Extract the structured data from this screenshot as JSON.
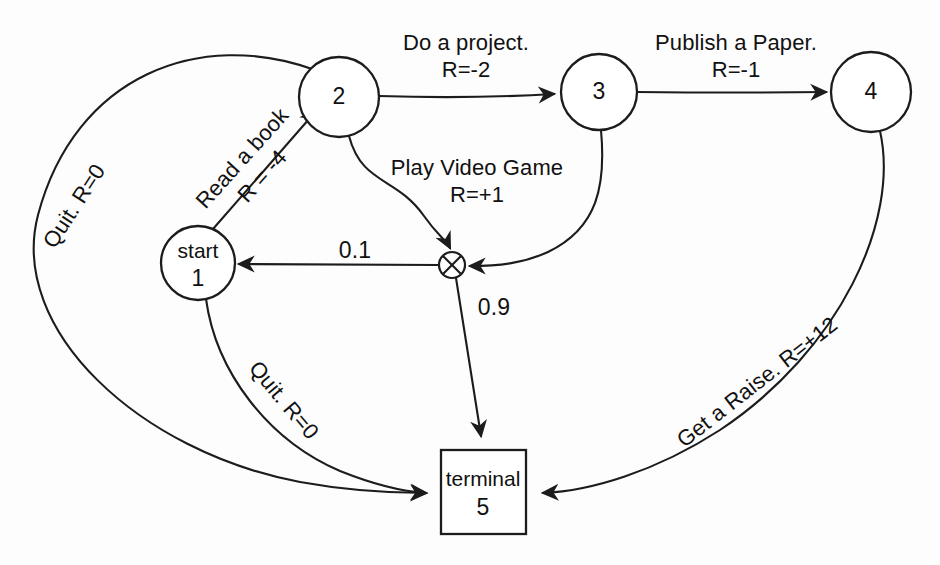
{
  "diagram": {
    "background_color": "#fdfdfd",
    "stroke_color": "#1c1c1c"
  },
  "nodes": [
    {
      "id": "start",
      "shape": "circle",
      "line1": "start",
      "line2": "1",
      "cx": 198,
      "cy": 263,
      "r": 37
    },
    {
      "id": "n2",
      "shape": "circle",
      "line1": "",
      "line2": "2",
      "cx": 339,
      "cy": 97,
      "r": 40
    },
    {
      "id": "n3",
      "shape": "circle",
      "line1": "",
      "line2": "3",
      "cx": 599,
      "cy": 92,
      "r": 38
    },
    {
      "id": "n4",
      "shape": "circle",
      "line1": "",
      "line2": "4",
      "cx": 871,
      "cy": 92,
      "r": 40
    },
    {
      "id": "terminal",
      "shape": "square",
      "line1": "terminal",
      "line2": "5",
      "cx": 483,
      "cy": 492,
      "w": 85,
      "h": 84
    },
    {
      "id": "junction",
      "shape": "crossed-circle",
      "line1": "",
      "line2": "",
      "cx": 452,
      "cy": 265,
      "r": 13
    }
  ],
  "edges": [
    {
      "id": "start-to-2",
      "from": "start",
      "to": "n2",
      "action": "Read a book",
      "reward": "R = -4",
      "label_line1": "Read a book",
      "label_line2": "R = -4",
      "label_x": 254,
      "label_y": 165,
      "rotation_deg": -48
    },
    {
      "id": "2-to-3",
      "from": "n2",
      "to": "n3",
      "action": "Do a project.",
      "reward": "R=-2",
      "label_line1": "Do a project.",
      "label_line2": "R=-2",
      "label_x": 466,
      "label_y": 56,
      "rotation_deg": 0
    },
    {
      "id": "3-to-4",
      "from": "n3",
      "to": "n4",
      "action": "Publish a Paper.",
      "reward": "R=-1",
      "label_line1": "Publish a Paper.",
      "label_line2": "R=-1",
      "label_x": 736,
      "label_y": 56,
      "rotation_deg": 0
    },
    {
      "id": "2-to-junction",
      "from": "n2",
      "to": "junction",
      "action": "Play Video Game",
      "reward": "R=+1",
      "label_line1": "Play Video Game",
      "label_line2": "R=+1",
      "label_x": 477,
      "label_y": 181,
      "rotation_deg": 0
    },
    {
      "id": "3-to-junction",
      "from": "n3",
      "to": "junction",
      "action": "",
      "reward": "",
      "label_line1": "",
      "label_line2": "",
      "label_x": 0,
      "label_y": 0,
      "rotation_deg": 0
    },
    {
      "id": "junction-to-start",
      "from": "junction",
      "to": "start",
      "action": "",
      "reward": "",
      "probability": "0.1",
      "label_x": 355,
      "label_y": 250,
      "rotation_deg": 0
    },
    {
      "id": "junction-to-terminal",
      "from": "junction",
      "to": "terminal",
      "action": "",
      "reward": "",
      "probability": "0.9",
      "label_x": 492,
      "label_y": 307,
      "rotation_deg": 0
    },
    {
      "id": "2-to-terminal",
      "from": "n2",
      "to": "terminal",
      "action": "Quit.",
      "reward": "R=0",
      "label_line1": "Quit. R=0",
      "label_line2": "",
      "label_x": 73,
      "label_y": 205,
      "rotation_deg": -57
    },
    {
      "id": "start-to-terminal",
      "from": "start",
      "to": "terminal",
      "action": "Quit.",
      "reward": "R=0",
      "label_line1": "Quit. R=0",
      "label_line2": "",
      "label_x": 283,
      "label_y": 400,
      "rotation_deg": 50
    },
    {
      "id": "4-to-terminal",
      "from": "n4",
      "to": "terminal",
      "action": "Get a Raise.",
      "reward": "R=+12",
      "label_line1": "Get a Raise. R=+12",
      "label_line2": "",
      "label_x": 755,
      "label_y": 385,
      "rotation_deg": -38
    }
  ],
  "labels": {
    "do_a_project": "Do a project.",
    "do_a_project_reward": "R=-2",
    "publish_a_paper": "Publish a Paper.",
    "publish_a_paper_reward": "R=-1",
    "read_a_book": "Read a book",
    "read_a_book_reward": "R = -4",
    "play_video_game": "Play Video Game",
    "play_video_game_reward": "R=+1",
    "quit_top": "Quit. R=0",
    "quit_bottom": "Quit. R=0",
    "get_a_raise": "Get a Raise. R=+12",
    "prob_low": "0.1",
    "prob_high": "0.9",
    "node_start_name": "start",
    "node_start_num": "1",
    "node_2": "2",
    "node_3": "3",
    "node_4": "4",
    "node_terminal_name": "terminal",
    "node_terminal_num": "5"
  }
}
